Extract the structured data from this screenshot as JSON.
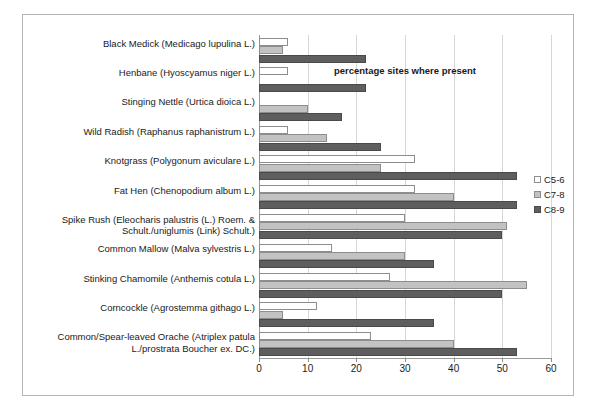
{
  "chart_data": {
    "type": "bar",
    "orientation": "horizontal",
    "title": "",
    "xlabel": "percentage sites where present",
    "ylabel": "",
    "xlim": [
      0,
      60
    ],
    "xticks": [
      0,
      10,
      20,
      30,
      40,
      50,
      60
    ],
    "grid": true,
    "legend_position": "right",
    "categories": [
      "Black Medick (Medicago lupulina L.)",
      "Henbane (Hyoscyamus niger L.)",
      "Stinging Nettle (Urtica dioica L.)",
      "Wild Radish (Raphanus raphanistrum L.)",
      "Knotgrass (Polygonum aviculare L.)",
      "Fat Hen (Chenopodium album L.)",
      "Spike Rush (Eleocharis palustris (L.) Roem. & Schult./uniglumis (Link) Schult.)",
      "Common Mallow (Malva sylvestris L.)",
      "Stinking Chamomile (Anthemis cotula L.)",
      "Corncockle (Agrostemma githago L.)",
      "Common/Spear-leaved Orache (Atriplex patula L./prostrata Boucher ex. DC.)"
    ],
    "series": [
      {
        "name": "C5-6",
        "color": "#ffffff",
        "values": [
          6,
          6,
          0,
          6,
          32,
          32,
          30,
          15,
          27,
          12,
          23
        ]
      },
      {
        "name": "C7-8",
        "color": "#c2c2c2",
        "values": [
          5,
          0,
          10,
          14,
          25,
          40,
          51,
          30,
          55,
          5,
          40
        ]
      },
      {
        "name": "C8-9",
        "color": "#5e5e5e",
        "values": [
          22,
          22,
          17,
          25,
          53,
          53,
          50,
          36,
          50,
          36,
          53
        ]
      }
    ]
  }
}
